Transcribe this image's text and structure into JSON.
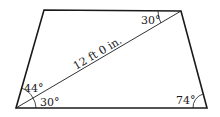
{
  "diagram": {
    "shape": "trapezoid",
    "diagonal_label": "12 ft 0 in.",
    "angles": {
      "bottom_left_upper": "44°",
      "bottom_left_lower": "30°",
      "top_right": "30°",
      "bottom_right": "74°"
    },
    "stroke_color": "#1a1a1a",
    "background_color": "#ffffff"
  }
}
